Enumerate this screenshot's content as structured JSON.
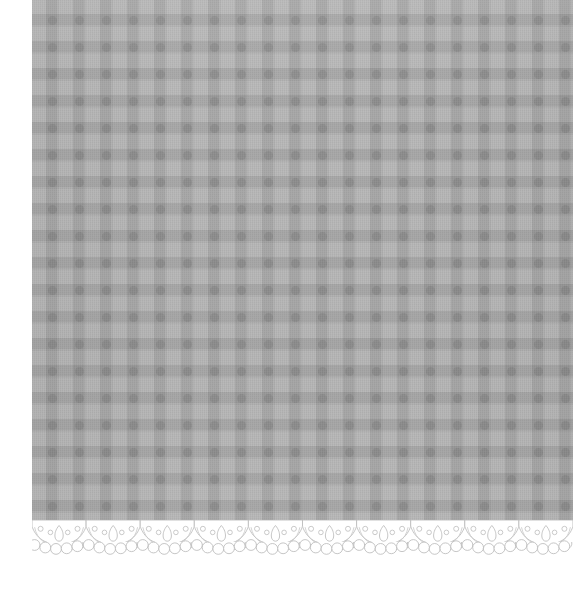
{
  "image": {
    "subject": "scalloped-lace-trimmed gingham fabric swatch",
    "alt_text": "Grey gingham checked fabric panel with a white scalloped lace border along the bottom edge",
    "canvas": {
      "width": 573,
      "height": 598,
      "background": "#ffffff"
    }
  },
  "fabric": {
    "name": "gingham-check-cloth",
    "label": "Gingham check fabric",
    "offset_x": 32,
    "offset_y": 0,
    "width": 541,
    "height": 532,
    "check_period_px": 27,
    "colors": {
      "base": "#a9a9a9",
      "light_check": "#b4b4b4",
      "mid_check": "#a6a6a6",
      "dark_check": "#999999"
    }
  },
  "lace": {
    "name": "scalloped-lace-trim",
    "label": "Scalloped lace border",
    "offset_x": 32,
    "offset_y": 520,
    "width": 541,
    "height": 44,
    "scallop_count": 10,
    "scallop_period_px": 54,
    "picots_per_scallop": 5,
    "dots_per_scallop": 4,
    "colors": {
      "lace_fill": "#ffffff",
      "lace_outline": "#b9b9b9",
      "lace_shadow": "#cfcfcf"
    }
  }
}
